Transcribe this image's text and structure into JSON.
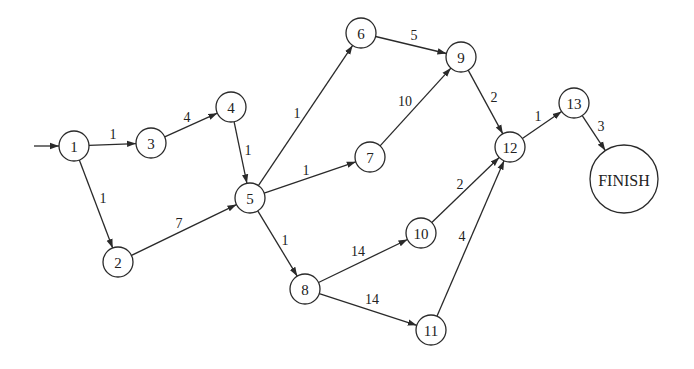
{
  "diagram": {
    "type": "activity-network",
    "background": "#ffffff",
    "stroke_color": "#2a2a2a",
    "nodes": [
      {
        "id": "1",
        "label": "1",
        "x": 74,
        "y": 146,
        "r": 15
      },
      {
        "id": "2",
        "label": "2",
        "x": 118,
        "y": 262,
        "r": 15
      },
      {
        "id": "3",
        "label": "3",
        "x": 151,
        "y": 143,
        "r": 15
      },
      {
        "id": "4",
        "label": "4",
        "x": 231,
        "y": 107,
        "r": 15
      },
      {
        "id": "5",
        "label": "5",
        "x": 250,
        "y": 198,
        "r": 15
      },
      {
        "id": "6",
        "label": "6",
        "x": 361,
        "y": 33,
        "r": 15
      },
      {
        "id": "7",
        "label": "7",
        "x": 370,
        "y": 157,
        "r": 15
      },
      {
        "id": "8",
        "label": "8",
        "x": 305,
        "y": 289,
        "r": 15
      },
      {
        "id": "9",
        "label": "9",
        "x": 461,
        "y": 57,
        "r": 15
      },
      {
        "id": "10",
        "label": "10",
        "x": 421,
        "y": 233,
        "r": 15
      },
      {
        "id": "11",
        "label": "11",
        "x": 431,
        "y": 330,
        "r": 15
      },
      {
        "id": "12",
        "label": "12",
        "x": 510,
        "y": 147,
        "r": 15
      },
      {
        "id": "13",
        "label": "13",
        "x": 574,
        "y": 103,
        "r": 15
      },
      {
        "id": "FINISH",
        "label": "FINISH",
        "x": 624,
        "y": 179,
        "r": 34
      }
    ],
    "start_arrow": {
      "x1": 34,
      "y1": 146,
      "to": "1"
    },
    "edges": [
      {
        "from": "1",
        "to": "3",
        "weight": "1",
        "lx": 113,
        "ly": 134
      },
      {
        "from": "1",
        "to": "2",
        "weight": "1",
        "lx": 103,
        "ly": 198
      },
      {
        "from": "3",
        "to": "4",
        "weight": "4",
        "lx": 187,
        "ly": 117
      },
      {
        "from": "4",
        "to": "5",
        "weight": "1",
        "lx": 248,
        "ly": 150
      },
      {
        "from": "2",
        "to": "5",
        "weight": "7",
        "lx": 179,
        "ly": 223
      },
      {
        "from": "5",
        "to": "6",
        "weight": "1",
        "lx": 297,
        "ly": 113
      },
      {
        "from": "5",
        "to": "7",
        "weight": "1",
        "lx": 306,
        "ly": 170
      },
      {
        "from": "5",
        "to": "8",
        "weight": "1",
        "lx": 285,
        "ly": 240
      },
      {
        "from": "6",
        "to": "9",
        "weight": "5",
        "lx": 414,
        "ly": 35
      },
      {
        "from": "7",
        "to": "9",
        "weight": "10",
        "lx": 405,
        "ly": 101
      },
      {
        "from": "9",
        "to": "12",
        "weight": "2",
        "lx": 494,
        "ly": 97
      },
      {
        "from": "8",
        "to": "10",
        "weight": "14",
        "lx": 358,
        "ly": 251
      },
      {
        "from": "8",
        "to": "11",
        "weight": "14",
        "lx": 372,
        "ly": 299
      },
      {
        "from": "10",
        "to": "12",
        "weight": "2",
        "lx": 460,
        "ly": 184
      },
      {
        "from": "11",
        "to": "12",
        "weight": "4",
        "lx": 462,
        "ly": 236
      },
      {
        "from": "12",
        "to": "13",
        "weight": "1",
        "lx": 538,
        "ly": 116
      },
      {
        "from": "13",
        "to": "FINISH",
        "weight": "3",
        "lx": 601,
        "ly": 126
      }
    ]
  }
}
